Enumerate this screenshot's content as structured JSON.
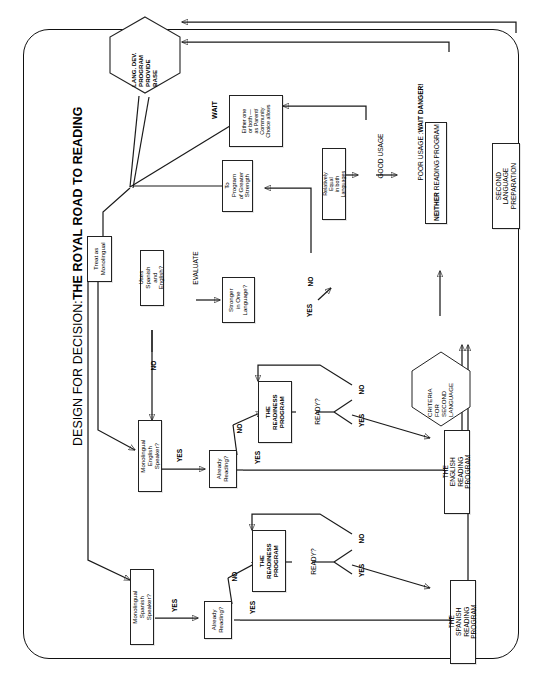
{
  "title": {
    "prefix": "DESIGN FOR DECISION: ",
    "emphasis": "THE ROYAL ROAD TO READING",
    "full": "DESIGN FOR DECISION: THE ROYAL ROAD TO READING"
  },
  "diagram": {
    "type": "flowchart",
    "orientation": "rotated-90-counterclockwise",
    "frame": "rounded-rectangle-border"
  },
  "nodes": {
    "lang_dev_program": "LANG. DEV.\nPROGRAM\nPROVIDE\nBASE",
    "treat_as_monolingual": "Treat as\nMonolingual",
    "either_one_or_both": "Either one\nor both —\nas Parent/\nCommunity\nChoice allows",
    "to_program_of_greater_strength": "To Program\nof Greater\nStrength",
    "relatively_equal": "Relatively Equal\nin both Languages",
    "second_language_preparation": "SECOND LANGUAGE\nPREPARATION",
    "criteria_for_second_language": "CRITERIA\nFOR\nSECOND\nLANGUAGE",
    "uses_spanish_and_english": "Uses Spanish\nand English?",
    "stronger_in_one_language": "Stronger\nin One\nLanguage?",
    "monolingual_english_speaker": "Monolingual\nEnglish Speaker?",
    "monolingual_spanish_speaker": "Monolingual\nSpanish Speaker?",
    "already_reading_english": "Already\nReading?",
    "already_reading_spanish": "Already\nReading?",
    "readiness_program_english": "THE\nREADINESS\nPROGRAM",
    "readiness_program_spanish": "THE\nREADINESS\nPROGRAM",
    "english_reading_program": "THE ENGLISH\nREADING PROGRAM",
    "spanish_reading_program": "THE SPANISH\nREADING PROGRAM"
  },
  "labels": {
    "wait_top": "WAIT",
    "evaluate": "EVALUATE",
    "good_usage": "GOOD USAGE",
    "poor_usage_prefix": "POOR USAGE : ",
    "poor_usage_emphasis": "WAIT DANGER!",
    "neither_prefix": "NEITHER",
    "neither_rest": " READING PROGRAM",
    "ready_english": "READY?",
    "ready_spanish": "READY?",
    "yes_stronger": "YES",
    "no_stronger": "NO",
    "no_uses": "NO",
    "yes_eng_speaker": "YES",
    "no_eng_speaker": "NO",
    "yes_span_speaker": "YES",
    "yes_already_eng": "YES",
    "no_already_eng": "NO",
    "yes_already_span": "YES",
    "no_already_span": "NO",
    "yes_ready_eng": "YES",
    "no_ready_eng": "NO",
    "yes_ready_span": "YES",
    "no_ready_span": "NO"
  },
  "colors": {
    "ink": "#1a1a1a",
    "paper": "#ffffff",
    "box_border": "#222222"
  }
}
